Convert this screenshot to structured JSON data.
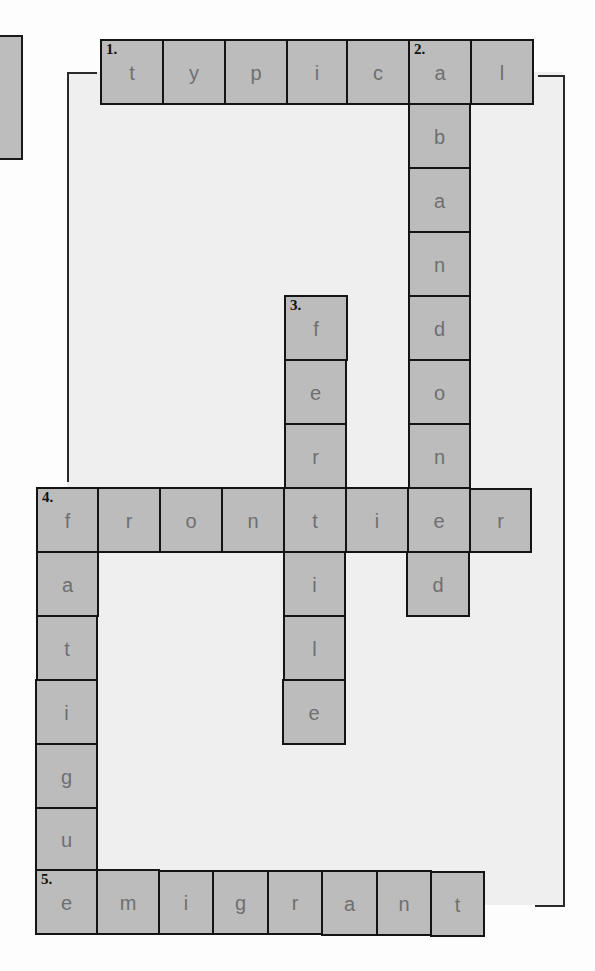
{
  "puzzle": {
    "type": "crossword",
    "colors": {
      "cell_fill": "#bcbcbc",
      "cell_border": "#141414",
      "letter": "#6f6f6f",
      "panel": "#efefef"
    },
    "words": [
      {
        "number": "1.",
        "direction": "across",
        "answer": "typical",
        "letters": [
          "t",
          "y",
          "p",
          "i",
          "c",
          "a",
          "l"
        ]
      },
      {
        "number": "2.",
        "direction": "down",
        "answer": "abandoned",
        "letters": [
          "a",
          "b",
          "a",
          "n",
          "d",
          "o",
          "n",
          "e",
          "d"
        ]
      },
      {
        "number": "3.",
        "direction": "down",
        "answer": "fertile",
        "letters": [
          "f",
          "e",
          "r",
          "t",
          "i",
          "l",
          "e"
        ]
      },
      {
        "number": "4.",
        "direction": "across",
        "answer": "frontier",
        "letters": [
          "f",
          "r",
          "o",
          "n",
          "t",
          "i",
          "e",
          "r"
        ]
      },
      {
        "number": "",
        "direction": "down",
        "answer": "fatigue",
        "letters": [
          "f",
          "a",
          "t",
          "i",
          "g",
          "u",
          "e"
        ]
      },
      {
        "number": "5.",
        "direction": "across",
        "answer": "emigrant",
        "letters": [
          "e",
          "m",
          "i",
          "g",
          "r",
          "a",
          "n",
          "t"
        ]
      }
    ]
  },
  "cells": {
    "w1": [
      "t",
      "y",
      "p",
      "i",
      "c",
      "a",
      "l"
    ],
    "w2": [
      "b",
      "a",
      "n",
      "d",
      "o",
      "n",
      "d"
    ],
    "w3": [
      "f",
      "e",
      "r",
      "i",
      "l",
      "e"
    ],
    "w4": [
      "f",
      "r",
      "o",
      "n",
      "t",
      "i",
      "e",
      "r"
    ],
    "wf": [
      "a",
      "t",
      "i",
      "g",
      "u"
    ],
    "w5": [
      "e",
      "m",
      "i",
      "g",
      "r",
      "a",
      "n",
      "t"
    ]
  },
  "numbers": {
    "n1": "1.",
    "n2": "2.",
    "n3": "3.",
    "n4": "4.",
    "n5": "5."
  }
}
